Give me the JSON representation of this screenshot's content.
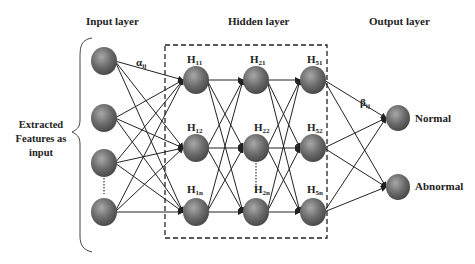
{
  "layers": {
    "input": {
      "title": "Input layer",
      "side_label_lines": [
        "Extracted",
        "Features as",
        "input"
      ],
      "weight_label": "α",
      "weight_sub": "ij"
    },
    "hidden": {
      "title": "Hidden layer",
      "nodes": [
        {
          "label": "H",
          "sub": "11"
        },
        {
          "label": "H",
          "sub": "12"
        },
        {
          "label": "H",
          "sub": "1n"
        },
        {
          "label": "H",
          "sub": "21"
        },
        {
          "label": "H",
          "sub": "22"
        },
        {
          "label": "H",
          "sub": "2n"
        },
        {
          "label": "H",
          "sub": "51"
        },
        {
          "label": "H",
          "sub": "52"
        },
        {
          "label": "H",
          "sub": "5n"
        }
      ]
    },
    "output": {
      "title": "Output layer",
      "weight_label": "β",
      "weight_sub": "ij",
      "nodes": [
        "Normal",
        "Abnormal"
      ]
    }
  },
  "colors": {
    "node": "#6e6e6e",
    "node_highlight": "#9a9a9a",
    "edge": "#222222",
    "dash_box": "#222222"
  }
}
